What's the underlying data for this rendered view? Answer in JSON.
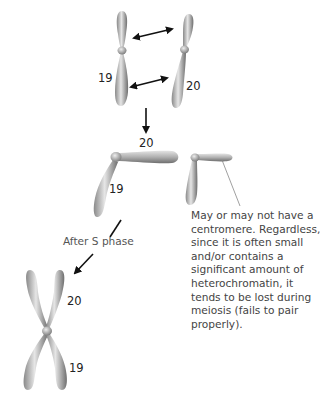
{
  "diagram": {
    "stage1": {
      "chromosome_left_label": "19",
      "chromosome_right_label": "20",
      "pairing_arrows": 2
    },
    "stage2": {
      "fused_arm_top_label": "20",
      "fused_arm_bottom_label": "19",
      "small_chromosome_note": "May or may not have a centromere. Regardless, since it is often small and/or contains a significant amount of heterochromatin, it tends to be lost during meiosis (fails to pair properly)."
    },
    "transition_label": "After S phase",
    "stage3": {
      "top_label": "20",
      "bottom_label": "19"
    },
    "colors": {
      "chromosome_light": "#e8e8e8",
      "chromosome_dark": "#7a7a7a",
      "arrow": "#111111",
      "pointer_line": "#888888"
    }
  }
}
